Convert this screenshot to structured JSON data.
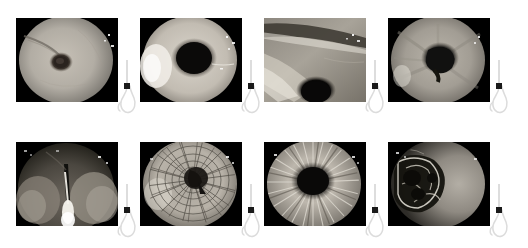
{
  "figure": {
    "title": "",
    "background_color": "#ffffff",
    "layout": {
      "rows": 2,
      "columns": 4,
      "panel_count": 8
    },
    "panel_frame_color": "#000000",
    "marker_color": "#1a1a1a",
    "anatomy_outline_color": "#d8d8d8"
  },
  "anatomy_icon": {
    "name": "stomach-esophagus-diagram",
    "marker_label": "",
    "marker_position": "gastroesophageal-junction",
    "description": "esophagus tube with black square scope-position marker above stomach outline"
  },
  "panels": [
    {
      "index": 1,
      "row": 0,
      "column": 0,
      "caption": "",
      "image_name": "endoscopy-image-1",
      "description": "pale mucosa with small dark central opening and linear fold",
      "marker_position": "gastroesophageal-junction",
      "base_tone": "#b5b0a8",
      "lumen": {
        "cx": 0.44,
        "cy": 0.52,
        "r": 0.11,
        "tone": "#2b2520"
      },
      "vignette": true
    },
    {
      "index": 2,
      "row": 0,
      "column": 1,
      "caption": "",
      "image_name": "endoscopy-image-2",
      "description": "large dark central lumen surrounded by bright mucosa, bright highlight left",
      "marker_position": "gastroesophageal-junction",
      "base_tone": "#c9c4bc",
      "lumen": {
        "cx": 0.53,
        "cy": 0.48,
        "r": 0.28,
        "tone": "#0d0b0a"
      },
      "vignette": true
    },
    {
      "index": 3,
      "row": 0,
      "column": 2,
      "caption": "",
      "image_name": "endoscopy-image-3",
      "description": "oblique mucosal fold crossing frame with dark lumen at lower centre",
      "marker_position": "gastroesophageal-junction",
      "base_tone": "#9b968f",
      "lumen": {
        "cx": 0.5,
        "cy": 0.82,
        "r": 0.17,
        "tone": "#0a0908"
      },
      "vignette": true
    },
    {
      "index": 4,
      "row": 0,
      "column": 3,
      "caption": "",
      "image_name": "endoscopy-image-4",
      "description": "converging gastric folds around irregular dark central lumen",
      "marker_position": "gastroesophageal-junction",
      "base_tone": "#a8a39b",
      "lumen": {
        "cx": 0.5,
        "cy": 0.5,
        "r": 0.2,
        "tone": "#101010"
      },
      "vignette": true
    },
    {
      "index": 5,
      "row": 1,
      "column": 0,
      "caption": "",
      "image_name": "endoscopy-image-5",
      "description": "dark field with bright vertical instrument / guidewire at centre bottom",
      "marker_position": "gastroesophageal-junction",
      "base_tone": "#4a4640",
      "lumen": {
        "cx": 0.47,
        "cy": 0.4,
        "r": 0.1,
        "tone": "#070706"
      },
      "vignette": true
    },
    {
      "index": 6,
      "row": 1,
      "column": 1,
      "caption": "",
      "image_name": "endoscopy-image-6",
      "description": "metal stent mesh lattice viewed down the lumen",
      "marker_position": "gastroesophageal-junction",
      "base_tone": "#b2aca3",
      "lumen": {
        "cx": 0.52,
        "cy": 0.44,
        "r": 0.16,
        "tone": "#1a1714"
      },
      "vignette": true,
      "overlay": "stent-mesh"
    },
    {
      "index": 7,
      "row": 1,
      "column": 2,
      "caption": "",
      "image_name": "endoscopy-image-7",
      "description": "radiating mucosal folds converging on dark central lumen",
      "marker_position": "gastroesophageal-junction",
      "base_tone": "#b9b3aa",
      "lumen": {
        "cx": 0.48,
        "cy": 0.46,
        "r": 0.22,
        "tone": "#0b0a09"
      },
      "vignette": true,
      "overlay": "radial-folds"
    },
    {
      "index": 8,
      "row": 1,
      "column": 3,
      "caption": "",
      "image_name": "endoscopy-image-8",
      "description": "irregular ulcerated lesion on left with smooth pale mucosa on right",
      "marker_position": "gastroesophageal-junction",
      "base_tone": "#8e8a83",
      "lumen": {
        "cx": 0.33,
        "cy": 0.48,
        "r": 0.24,
        "tone": "#0a0a09"
      },
      "vignette": true,
      "overlay": "lesion"
    }
  ]
}
